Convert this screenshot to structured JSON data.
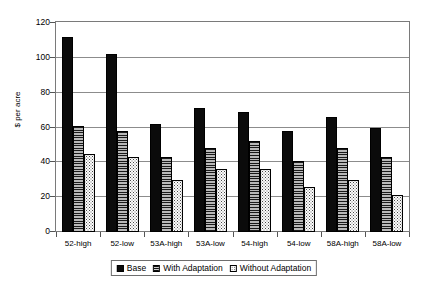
{
  "chart_data": {
    "type": "bar",
    "title": "",
    "xlabel": "",
    "ylabel": "$ per acre",
    "ylim": [
      0,
      120
    ],
    "yticks": [
      0,
      20,
      40,
      60,
      80,
      100,
      120
    ],
    "grid": true,
    "legend_position": "bottom",
    "categories": [
      "52-high",
      "52-low",
      "53A-high",
      "53A-low",
      "54-high",
      "54-low",
      "58A-high",
      "58A-low"
    ],
    "series": [
      {
        "name": "Base",
        "values": [
          112,
          102,
          62,
          71,
          69,
          58,
          66,
          60
        ]
      },
      {
        "name": "With Adaptation",
        "values": [
          61,
          58,
          43,
          48,
          52,
          41,
          48,
          43
        ]
      },
      {
        "name": "Without Adaptation",
        "values": [
          45,
          43,
          30,
          36,
          36,
          26,
          30,
          21
        ]
      }
    ]
  },
  "legend": {
    "items": [
      {
        "label": "Base"
      },
      {
        "label": "With Adaptation"
      },
      {
        "label": "Without Adaptation"
      }
    ]
  }
}
